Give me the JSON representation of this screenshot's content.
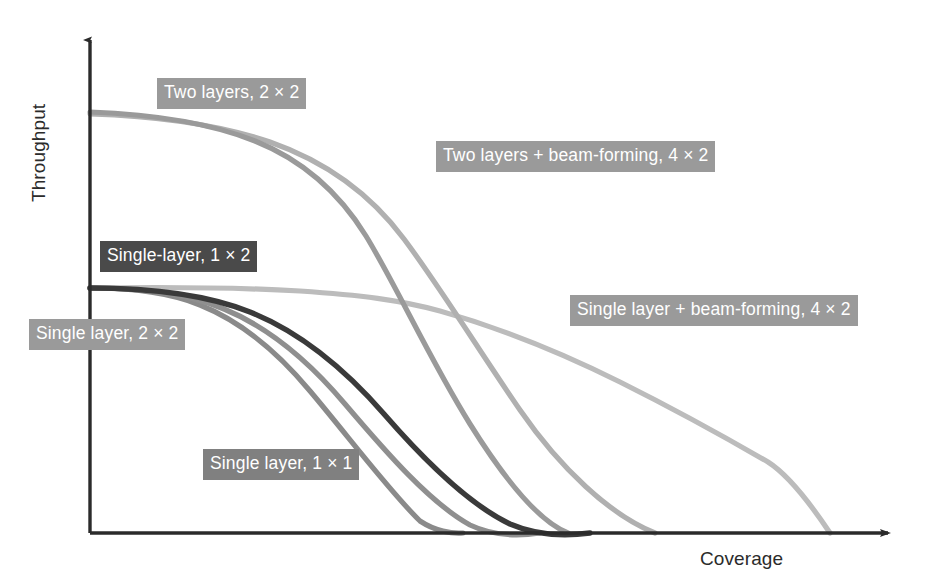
{
  "figure": {
    "axes": {
      "y_label": "Throughput",
      "x_label": "Coverage",
      "axis_color": "#2b2b2b"
    }
  },
  "chart_data": {
    "type": "line",
    "title": "",
    "xlabel": "Coverage",
    "ylabel": "Throughput",
    "xlim": [
      0,
      100
    ],
    "ylim": [
      0,
      100
    ],
    "grid": false,
    "legend": "inline-labels",
    "axis_ticks": "none",
    "note": "Qualitative schematic: throughput versus coverage roll-off curves for MIMO antenna configurations. Values are normalized 0-100 read off the unlabeled axes.",
    "series": [
      {
        "name": "Two layers, 2 x 2",
        "label": "Two layers, 2 × 2",
        "color": "#9a9a9a",
        "label_box_color": "#9a9a9a",
        "x": [
          0,
          6,
          12,
          19,
          25,
          31,
          36,
          41,
          45,
          48,
          51,
          54,
          56,
          57
        ],
        "y": [
          84,
          83,
          81,
          77,
          72,
          64,
          54,
          42,
          30,
          21,
          13,
          6,
          2,
          0
        ]
      },
      {
        "name": "Two layers + beam-forming, 4 x 2",
        "label": "Two layers + beam-forming, 4 × 2",
        "color": "#b0b0b0",
        "label_box_color": "#9a9a9a",
        "x": [
          0,
          8,
          16,
          24,
          31,
          37,
          43,
          48,
          53,
          58,
          62,
          65,
          67,
          69,
          70
        ],
        "y": [
          84,
          83,
          81,
          78,
          74,
          68,
          60,
          50,
          39,
          28,
          18,
          11,
          6,
          2,
          0
        ]
      },
      {
        "name": "Single layer + beam-forming, 4 x 2",
        "label": "Single layer + beam-forming, 4 × 2",
        "color": "#bcbcbc",
        "label_box_color": "#9a9a9a",
        "x": [
          0,
          8,
          16,
          24,
          31,
          37,
          43,
          50,
          57,
          64,
          71,
          77,
          81,
          85,
          88,
          89
        ],
        "y": [
          49,
          49,
          49,
          48,
          47,
          45,
          42,
          38,
          33,
          27,
          21,
          15,
          10,
          5,
          1,
          0
        ]
      },
      {
        "name": "Single-layer, 1 x 2",
        "label": "Single-layer, 1 × 2",
        "color": "#3a3a3a",
        "label_box_color": "#4a4a4a",
        "x": [
          0,
          6,
          12,
          18,
          24,
          30,
          36,
          42,
          48,
          53,
          57,
          60,
          61
        ],
        "y": [
          49,
          49,
          48,
          46,
          42,
          37,
          31,
          24,
          17,
          10,
          5,
          1,
          0
        ]
      },
      {
        "name": "Single layer, 1 x 1",
        "label": "Single layer, 1 × 1",
        "color": "#8f8f8f",
        "label_box_color": "#808080",
        "x": [
          0,
          5,
          11,
          17,
          23,
          28,
          33,
          38,
          43,
          47,
          51,
          54,
          55
        ],
        "y": [
          49,
          48,
          47,
          44,
          40,
          35,
          29,
          23,
          16,
          10,
          5,
          1,
          0
        ]
      },
      {
        "name": "Single layer, 2 x 2",
        "label": "Single layer, 2 × 2",
        "color": "#8a8a8a",
        "label_box_color": "#9a9a9a",
        "x": [
          0,
          4,
          9,
          14,
          19,
          24,
          29,
          33,
          37,
          41,
          43,
          45,
          46
        ],
        "y": [
          49,
          48,
          46,
          43,
          38,
          32,
          26,
          19,
          13,
          7,
          3,
          1,
          0
        ]
      }
    ]
  },
  "labels": [
    {
      "id": "two-layers-2x2",
      "text": "Two layers, 2 × 2",
      "bg": "#9a9a9a",
      "left": 157,
      "top": 78
    },
    {
      "id": "two-layers-bf-4x2",
      "text": "Two layers + beam-forming, 4 × 2",
      "bg": "#9a9a9a",
      "left": 436,
      "top": 141
    },
    {
      "id": "single-layer-1x2",
      "text": "Single-layer, 1 × 2",
      "bg": "#4a4a4a",
      "left": 100,
      "top": 241
    },
    {
      "id": "single-layer-bf-4x2",
      "text": "Single layer + beam-forming, 4 × 2",
      "bg": "#9a9a9a",
      "left": 570,
      "top": 295
    },
    {
      "id": "single-layer-2x2",
      "text": "Single layer, 2 × 2",
      "bg": "#9a9a9a",
      "left": 29,
      "top": 319
    },
    {
      "id": "single-layer-1x1",
      "text": "Single layer, 1 × 1",
      "bg": "#808080",
      "left": 203,
      "top": 449
    }
  ]
}
